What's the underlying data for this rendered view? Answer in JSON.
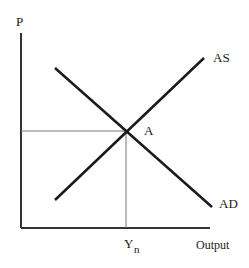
{
  "diagram": {
    "type": "AS-AD model",
    "axes": {
      "y_label": "P",
      "x_label": "Output"
    },
    "curves": [
      {
        "name": "AS",
        "label": "AS",
        "direction": "upward-sloping"
      },
      {
        "name": "AD",
        "label": "AD",
        "direction": "downward-sloping"
      }
    ],
    "equilibrium": {
      "point_label": "A",
      "x_marker_label": "Y",
      "x_marker_subscript": "n"
    }
  }
}
